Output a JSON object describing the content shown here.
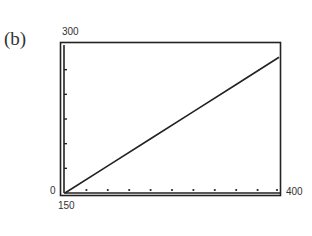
{
  "panel_label": "(b)",
  "chart_data": {
    "type": "line",
    "title": "",
    "xlabel": "",
    "ylabel": "",
    "xlim": [
      150,
      400
    ],
    "ylim": [
      0,
      300
    ],
    "x_tick_labels": [
      "150",
      "400"
    ],
    "y_tick_labels": [
      "0",
      "300"
    ],
    "x_ticks": [
      175,
      200,
      225,
      250,
      275,
      300,
      325,
      350,
      375,
      400
    ],
    "y_ticks": [
      50,
      100,
      150,
      200,
      250
    ],
    "grid": false,
    "legend": null,
    "series": [
      {
        "name": "line",
        "x": [
          150,
          200,
          250,
          300,
          350,
          400
        ],
        "y": [
          0,
          55,
          110,
          165,
          220,
          275
        ]
      }
    ]
  },
  "axis": {
    "y_max_label": "300",
    "y_min_label": "0",
    "x_min_label": "150",
    "x_max_label": "400"
  }
}
